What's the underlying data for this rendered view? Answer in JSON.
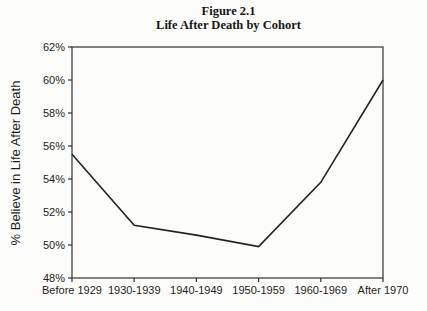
{
  "figure": {
    "title_line1": "Figure 2.1",
    "title_line2": "Life After Death by Cohort"
  },
  "chart_data": {
    "type": "line",
    "title": "Figure 2.1",
    "subtitle": "Life After Death by Cohort",
    "categories": [
      "Before 1929",
      "1930-1939",
      "1940-1949",
      "1950-1959",
      "1960-1969",
      "After 1970"
    ],
    "series": [
      {
        "name": "% Believe in Life After Death",
        "values": [
          55.5,
          51.2,
          50.6,
          49.9,
          53.8,
          60.0
        ]
      }
    ],
    "xlabel": "",
    "ylabel": "% Believe in Life After Death",
    "ylim": [
      48,
      62
    ],
    "ytick_step": 2,
    "ytick_labels": [
      "48%",
      "50%",
      "52%",
      "54%",
      "56%",
      "58%",
      "60%",
      "62%"
    ],
    "grid": false,
    "legend_position": "none",
    "line_color": "#222222",
    "axis_color": "#333333",
    "marker": "none"
  }
}
